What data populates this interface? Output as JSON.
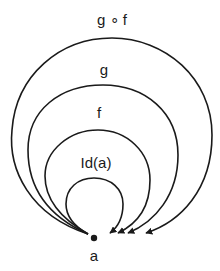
{
  "diagram": {
    "type": "category-theory-morphisms",
    "object": {
      "label": "a"
    },
    "morphisms": [
      {
        "id": "comp",
        "label": "g ∘ f"
      },
      {
        "id": "g",
        "label": "g"
      },
      {
        "id": "f",
        "label": "f"
      },
      {
        "id": "id",
        "label": "Id(a)"
      }
    ]
  },
  "colors": {
    "stroke": "#1a1a1a",
    "background": "#ffffff"
  }
}
